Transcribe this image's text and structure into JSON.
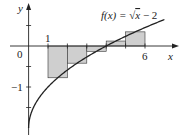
{
  "chart_data": {
    "type": "area",
    "title": "",
    "function_label": "f(x) = √x − 2",
    "function": "sqrt(x) - 2",
    "xlabel": "x",
    "ylabel": "y",
    "x_ticks": [
      {
        "value": 1,
        "label": "1"
      },
      {
        "value": 6,
        "label": "6"
      }
    ],
    "y_ticks": [
      {
        "value": 0,
        "label": "0"
      },
      {
        "value": -1,
        "label": "−1"
      }
    ],
    "xlim": [
      0,
      7
    ],
    "ylim": [
      -2,
      1
    ],
    "approximation": "midpoint rectangles",
    "rectangles": [
      {
        "x0": 1,
        "x1": 2,
        "height": -0.775
      },
      {
        "x0": 2,
        "x1": 3,
        "height": -0.419
      },
      {
        "x0": 3,
        "x1": 4,
        "height": -0.129
      },
      {
        "x0": 4,
        "x1": 5,
        "height": 0.121
      },
      {
        "x0": 5,
        "x1": 6,
        "height": 0.345
      }
    ],
    "colors": {
      "rect_fill": "#cfcfcf",
      "line": "#222222"
    }
  },
  "labels": {
    "y_axis": "y",
    "x_axis": "x",
    "origin": "0",
    "x_one": "1",
    "x_six": "6",
    "y_neg_one": "−1",
    "func_f": "f(x) = √",
    "func_x": "x",
    "func_rest": " − 2"
  }
}
